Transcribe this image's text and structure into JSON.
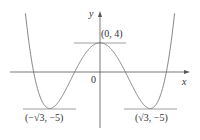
{
  "chart_data": {
    "type": "line",
    "title": "",
    "xlabel": "x",
    "ylabel": "y",
    "function": "y = x^4 - 6x^2 + 4",
    "origin_label": "0",
    "points": [
      {
        "label": "(0, 4)",
        "x": 0,
        "y": 4,
        "kind": "local maximum"
      },
      {
        "label": "(−√3, −5)",
        "x": -1.732,
        "y": -5,
        "kind": "local minimum"
      },
      {
        "label": "(√3, −5)",
        "x": 1.732,
        "y": -5,
        "kind": "local minimum"
      }
    ],
    "x": [
      -2.6,
      -2.4,
      -2.0,
      -1.732,
      -1.5,
      -1.0,
      -0.5,
      0,
      0.5,
      1.0,
      1.5,
      1.732,
      2.0,
      2.4,
      2.6
    ],
    "y": [
      14.1,
      2.6,
      -4.0,
      -5.0,
      -4.44,
      -1.0,
      2.56,
      4.0,
      2.56,
      -1.0,
      -4.44,
      -5.0,
      -4.0,
      2.6,
      14.1
    ],
    "horizontal_tangents": [
      4,
      -5
    ],
    "grid": false
  },
  "labels": {
    "y_axis": "y",
    "x_axis": "x",
    "origin": "0",
    "max_point": "(0, 4)",
    "min_left": "(−√3, −5)",
    "min_right": "(√3, −5)"
  }
}
